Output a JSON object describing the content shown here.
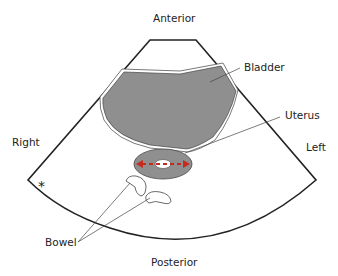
{
  "diagram": {
    "type": "ultrasound-transverse-pelvis-schematic",
    "orientation_labels": {
      "top": "Anterior",
      "bottom": "Posterior",
      "left": "Right",
      "right": "Left"
    },
    "structure_labels": {
      "bladder": "Bladder",
      "uterus": "Uterus",
      "bowel": "Bowel"
    },
    "marker": "*",
    "colors": {
      "outline": "#222222",
      "organ_fill": "#8f8f8f",
      "arrow": "#c62a1f",
      "background": "#ffffff"
    }
  }
}
